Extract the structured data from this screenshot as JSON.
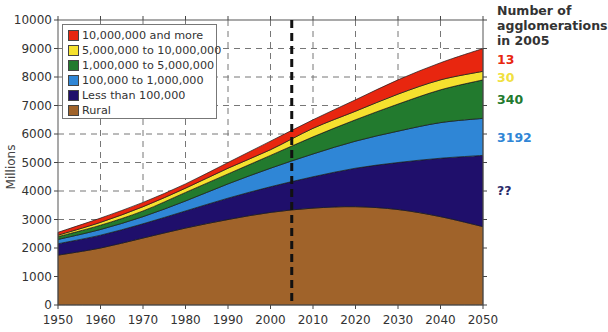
{
  "chart_data": {
    "type": "area",
    "stacked": true,
    "title": "",
    "xlabel": "",
    "ylabel": "Millions",
    "xlim": [
      1950,
      2050
    ],
    "ylim": [
      0,
      10000
    ],
    "x": [
      1950,
      1960,
      1970,
      1980,
      1990,
      2000,
      2010,
      2020,
      2030,
      2040,
      2050
    ],
    "x_ticks": [
      "1950",
      "1960",
      "1970",
      "1980",
      "1990",
      "2000",
      "2010",
      "2020",
      "2030",
      "2040",
      "2050"
    ],
    "y_ticks": [
      "0",
      "1000",
      "2000",
      "3000",
      "4000",
      "5000",
      "6000",
      "7000",
      "8000",
      "9000",
      "10000"
    ],
    "grid": "dashed",
    "marker_line": {
      "x": 2005,
      "style": "thick dashed"
    },
    "series": [
      {
        "name": "Rural",
        "color": "#a0632a",
        "cumulative_top": [
          1750,
          2000,
          2350,
          2700,
          3000,
          3250,
          3400,
          3450,
          3350,
          3100,
          2750
        ]
      },
      {
        "name": "Less than 100,000",
        "color": "#1f0f6b",
        "cumulative_top": [
          2150,
          2450,
          2850,
          3300,
          3750,
          4150,
          4500,
          4800,
          5000,
          5150,
          5250
        ]
      },
      {
        "name": "100,000 to 1,000,000",
        "color": "#2f86d6",
        "cumulative_top": [
          2300,
          2650,
          3100,
          3650,
          4250,
          4800,
          5300,
          5750,
          6100,
          6400,
          6550
        ]
      },
      {
        "name": "1,000,000 to 5,000,000",
        "color": "#227a2e",
        "cumulative_top": [
          2400,
          2800,
          3300,
          3950,
          4600,
          5250,
          5900,
          6500,
          7050,
          7550,
          7900
        ]
      },
      {
        "name": "5,000,000 to 10,000,000",
        "color": "#f5e12e",
        "cumulative_top": [
          2450,
          2900,
          3450,
          4100,
          4800,
          5450,
          6200,
          6800,
          7400,
          7900,
          8200
        ]
      },
      {
        "name": "10,000,000 and more",
        "color": "#e8260f",
        "cumulative_top": [
          2550,
          3050,
          3600,
          4250,
          5000,
          5750,
          6500,
          7200,
          7900,
          8500,
          9000
        ]
      }
    ],
    "legend": {
      "position": "top-left",
      "entries": [
        {
          "label": "10,000,000 and more",
          "color": "#e8260f"
        },
        {
          "label": "5,000,000 to 10,000,000",
          "color": "#f5e12e"
        },
        {
          "label": "1,000,000 to 5,000,000",
          "color": "#227a2e"
        },
        {
          "label": "100,000 to 1,000,000",
          "color": "#2f86d6"
        },
        {
          "label": "Less than 100,000",
          "color": "#1f0f6b"
        },
        {
          "label": "Rural",
          "color": "#a0632a"
        }
      ]
    },
    "annotations": {
      "title_lines": [
        "Number of",
        "agglomerations",
        "in 2005"
      ],
      "values": [
        {
          "text": "13",
          "color": "#e8260f"
        },
        {
          "text": "30",
          "color": "#f0e040"
        },
        {
          "text": "340",
          "color": "#227a2e"
        },
        {
          "text": "3192",
          "color": "#2f86d6"
        },
        {
          "text": "??",
          "color": "#2a2a6a"
        }
      ]
    }
  }
}
